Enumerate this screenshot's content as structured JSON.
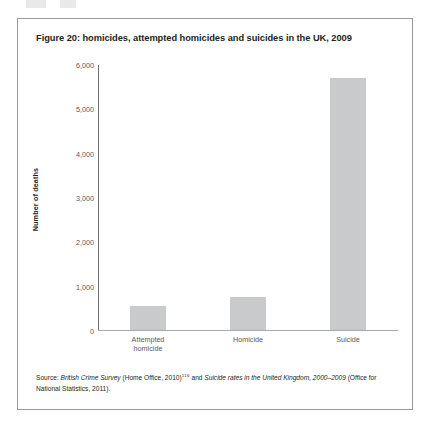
{
  "figure": {
    "title": "Figure 20: homicides, attempted homicides and suicides in the UK, 2009",
    "border_color": "#9a9a9a"
  },
  "source": {
    "lead": "Source: ",
    "part1_italic": "British Crime Survey",
    "part2": " (Home Office, 2010)",
    "superscript": "116",
    "part3": " and ",
    "part4_italic": "Suicide rates in the United Kingdom, 2000–2009",
    "part5": " (Office for National Statistics, 2011)."
  },
  "chart_data": {
    "type": "bar",
    "title": "Figure 20: homicides, attempted homicides and suicides in the UK, 2009",
    "xlabel": "",
    "ylabel": "Number of deaths",
    "categories": [
      "Attempted homicide",
      "Homicide",
      "Suicide"
    ],
    "category_lines": [
      [
        "Attempted",
        "homicide"
      ],
      [
        "Homicide"
      ],
      [
        "Suicide"
      ]
    ],
    "values": [
      550,
      740,
      5675
    ],
    "ylim": [
      0,
      6000
    ],
    "yticks": [
      0,
      1000,
      2000,
      3000,
      4000,
      5000,
      6000
    ],
    "ytick_labels": [
      "0",
      "1,000",
      "2,000",
      "3,000",
      "4,000",
      "5,000",
      "6,000"
    ],
    "grid": false,
    "legend": false,
    "bar_color": "#c9cacb",
    "axis_color": "#6d6e71",
    "text_color": "#58595b"
  }
}
